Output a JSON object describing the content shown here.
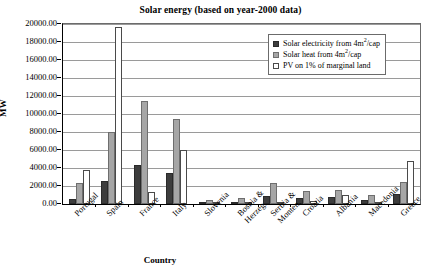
{
  "chart_data": {
    "type": "bar",
    "title": "Solar energy (based on year-2000 data)",
    "xlabel": "Country",
    "ylabel": "MW",
    "ylim": [
      0,
      20000
    ],
    "ytick_step": 2000,
    "grid": true,
    "legend_position": "top-right-inside",
    "categories": [
      "Portugal",
      "Spain",
      "France",
      "Italy",
      "Slovenia",
      "Bosnia & Herzeg.",
      "Serbia & Monten.",
      "Croatia",
      "Albania",
      "Macedonia",
      "Greece"
    ],
    "category_lines": [
      [
        "Portugal",
        ""
      ],
      [
        "Spain",
        ""
      ],
      [
        "France",
        ""
      ],
      [
        "Italy",
        ""
      ],
      [
        "Slovenia",
        ""
      ],
      [
        "Bosnia &",
        "Herzeg."
      ],
      [
        "Serbia &",
        "Monten."
      ],
      [
        "Croatia",
        ""
      ],
      [
        "Albania",
        ""
      ],
      [
        "Macedonia",
        ""
      ],
      [
        "Greece",
        ""
      ]
    ],
    "ytick_labels": [
      "20000.00",
      "18000.00",
      "16000.00",
      "14000.00",
      "12000.00",
      "10000.00",
      "8000.00",
      "6000.00",
      "4000.00",
      "2000.00",
      "0.00"
    ],
    "series": [
      {
        "name": "Solar electricity from 4m2/cap",
        "color": "#3d3d3d",
        "values": [
          550,
          2600,
          4300,
          3400,
          180,
          230,
          900,
          700,
          800,
          450,
          1100
        ]
      },
      {
        "name": "Solar heat from 4m2/cap",
        "color": "#a6a6a6",
        "values": [
          2300,
          8000,
          11500,
          9400,
          420,
          620,
          2300,
          1500,
          1600,
          1000,
          2400
        ]
      },
      {
        "name": "PV on 1% of marginal land",
        "color": "#ffffff",
        "values": [
          3750,
          19700,
          1300,
          6000,
          120,
          180,
          140,
          300,
          1000,
          260,
          4800
        ]
      }
    ]
  },
  "legend": {
    "items": [
      {
        "prefix": "Solar electricity from 4m",
        "sup": "2",
        "suffix": "/cap"
      },
      {
        "prefix": "Solar heat from 4m",
        "sup": "2",
        "suffix": "/cap"
      },
      {
        "prefix": "PV on 1% of marginal land",
        "sup": "",
        "suffix": ""
      }
    ]
  }
}
